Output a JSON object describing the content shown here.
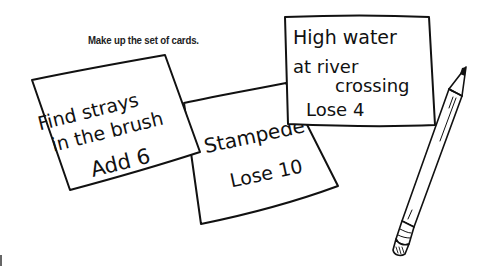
{
  "instruction": "Make up the set of cards.",
  "cards": [
    {
      "id": "stampede",
      "lines": [
        "Stampede",
        "Lose 10"
      ]
    },
    {
      "id": "find-strays",
      "lines": [
        "Find strays",
        "in the brush",
        "Add 6"
      ]
    },
    {
      "id": "high-water",
      "lines": [
        "High water",
        "at river",
        "crossing",
        "Lose 4"
      ]
    }
  ],
  "illustration": {
    "pencil": "pencil-icon"
  },
  "colors": {
    "ink": "#111111",
    "paper": "#ffffff"
  }
}
